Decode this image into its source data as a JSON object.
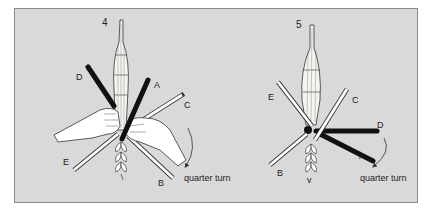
{
  "figure": {
    "background": "#d9d9d9",
    "border_color": "#8a8a8a",
    "panels": [
      {
        "step": "4",
        "straw_labels": {
          "A": "A",
          "B": "B",
          "C": "C",
          "D": "D",
          "E": "E"
        },
        "caption": "quarter turn"
      },
      {
        "step": "5",
        "straw_labels": {
          "A": "A",
          "B": "B",
          "C": "C",
          "D": "D",
          "E": "E"
        },
        "caption": "quarter turn"
      }
    ]
  }
}
